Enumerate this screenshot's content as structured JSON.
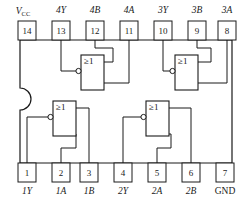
{
  "diagram": {
    "package": "DIP-14",
    "gate_symbol": "≥1",
    "line_color": "#1a1a1a",
    "background_color": "#ffffff"
  },
  "top_pins": [
    {
      "number": "14",
      "label": "V",
      "label_sub": "CC",
      "italic": true
    },
    {
      "number": "13",
      "label": "4Y",
      "label_sub": "",
      "italic": true
    },
    {
      "number": "12",
      "label": "4B",
      "label_sub": "",
      "italic": true
    },
    {
      "number": "11",
      "label": "4A",
      "label_sub": "",
      "italic": true
    },
    {
      "number": "10",
      "label": "3Y",
      "label_sub": "",
      "italic": true
    },
    {
      "number": "9",
      "label": "3B",
      "label_sub": "",
      "italic": true
    },
    {
      "number": "8",
      "label": "3A",
      "label_sub": "",
      "italic": true
    }
  ],
  "bottom_pins": [
    {
      "number": "1",
      "label": "1Y",
      "label_sub": "",
      "italic": true
    },
    {
      "number": "2",
      "label": "1A",
      "label_sub": "",
      "italic": true
    },
    {
      "number": "3",
      "label": "1B",
      "label_sub": "",
      "italic": true
    },
    {
      "number": "4",
      "label": "2Y",
      "label_sub": "",
      "italic": true
    },
    {
      "number": "5",
      "label": "2A",
      "label_sub": "",
      "italic": true
    },
    {
      "number": "6",
      "label": "2B",
      "label_sub": "",
      "italic": true
    },
    {
      "number": "7",
      "label": "GND",
      "label_sub": "",
      "italic": false
    }
  ],
  "gates": [
    {
      "id": "gate-4",
      "symbol": "≥1",
      "output_pin": "13",
      "input_pins": [
        "12",
        "11"
      ]
    },
    {
      "id": "gate-3",
      "symbol": "≥1",
      "output_pin": "10",
      "input_pins": [
        "9",
        "8"
      ]
    },
    {
      "id": "gate-1",
      "symbol": "≥1",
      "output_pin": "1",
      "input_pins": [
        "2",
        "3"
      ]
    },
    {
      "id": "gate-2",
      "symbol": "≥1",
      "output_pin": "4",
      "input_pins": [
        "5",
        "6"
      ]
    }
  ]
}
